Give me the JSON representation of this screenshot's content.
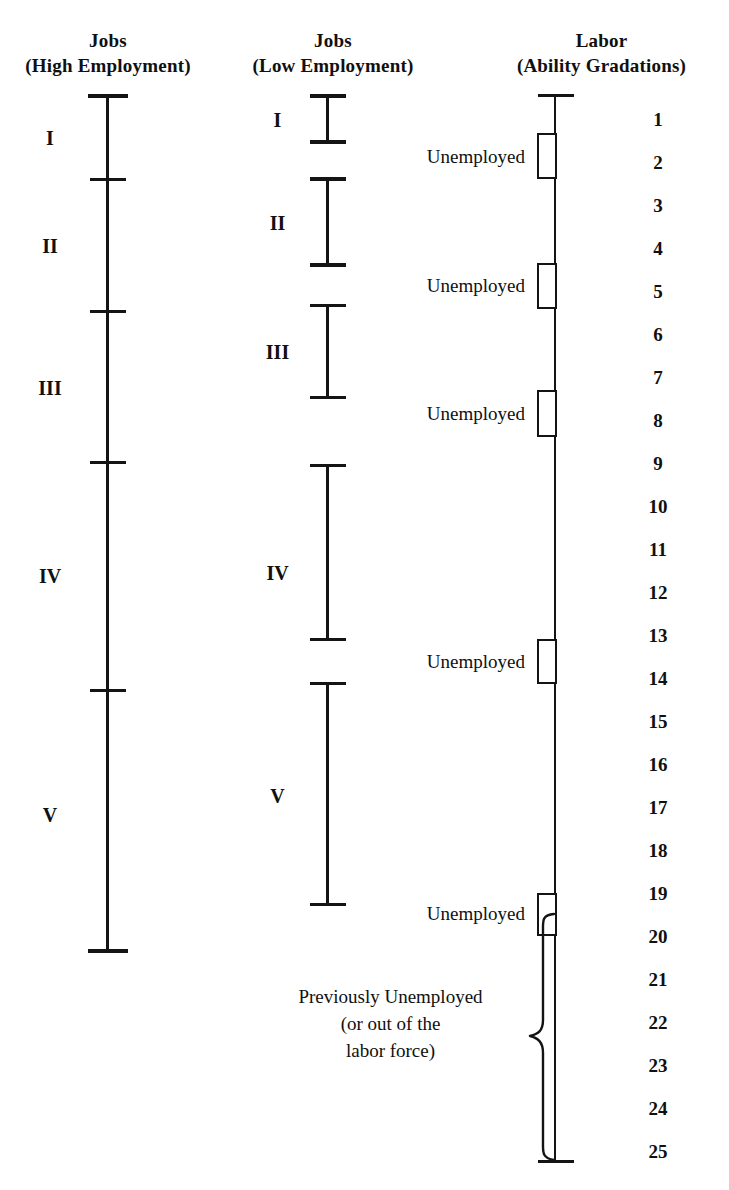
{
  "figure": {
    "title_hidden": "",
    "columns": [
      {
        "id": "jobs-high",
        "title_line1": "Jobs",
        "title_line2": "(High Employment)"
      },
      {
        "id": "jobs-low",
        "title_line1": "Jobs",
        "title_line2": "(Low Employment)"
      },
      {
        "id": "labor",
        "title_line1": "Labor",
        "title_line2": "(Ability Gradations)"
      }
    ]
  },
  "jobs_high": {
    "segments": [
      {
        "label": "I"
      },
      {
        "label": "II"
      },
      {
        "label": "III"
      },
      {
        "label": "IV"
      },
      {
        "label": "V"
      }
    ]
  },
  "jobs_low": {
    "segments": [
      {
        "label": "I"
      },
      {
        "label": "II"
      },
      {
        "label": "III"
      },
      {
        "label": "IV"
      },
      {
        "label": "V"
      }
    ]
  },
  "labor": {
    "unemployed_labels": [
      {
        "text": "Unemployed"
      },
      {
        "text": "Unemployed"
      },
      {
        "text": "Unemployed"
      },
      {
        "text": "Unemployed"
      },
      {
        "text": "Unemployed"
      }
    ],
    "brace_label": "Previously Unemployed\n(or out of the\nlabor force)",
    "gradations": [
      "1",
      "2",
      "3",
      "4",
      "5",
      "6",
      "7",
      "8",
      "9",
      "10",
      "11",
      "12",
      "13",
      "14",
      "15",
      "16",
      "17",
      "18",
      "19",
      "20",
      "21",
      "22",
      "23",
      "24",
      "25"
    ]
  },
  "chart_data": {
    "type": "diagram",
    "series": [
      {
        "name": "Jobs (High Employment)",
        "note": "continuous axis with internal tick divisions",
        "segments": [
          {
            "label": "I",
            "top_grade": 1,
            "bottom_grade": 2
          },
          {
            "label": "II",
            "top_grade": 2,
            "bottom_grade": 5
          },
          {
            "label": "III",
            "top_grade": 5,
            "bottom_grade": 9
          },
          {
            "label": "IV",
            "top_grade": 9,
            "bottom_grade": 14
          },
          {
            "label": "V",
            "top_grade": 14,
            "bottom_grade": 25
          }
        ]
      },
      {
        "name": "Jobs (Low Employment)",
        "note": "separated segments with unemployment gaps between them",
        "segments": [
          {
            "label": "I",
            "top_grade": 1,
            "bottom_grade": 2
          },
          {
            "label": "II",
            "top_grade": 3,
            "bottom_grade": 5
          },
          {
            "label": "III",
            "top_grade": 6,
            "bottom_grade": 9
          },
          {
            "label": "IV",
            "top_grade": 10,
            "bottom_grade": 14
          },
          {
            "label": "V",
            "top_grade": 15,
            "bottom_grade": 20
          }
        ]
      },
      {
        "name": "Labor (Ability Gradations)",
        "note": "continuous axis, grades 1 through 25, with 5 unemployment brackets and a bottom brace",
        "unemployed_brackets": [
          {
            "label": "Unemployed",
            "near_grade": 2
          },
          {
            "label": "Unemployed",
            "near_grade": 5
          },
          {
            "label": "Unemployed",
            "near_grade": 9
          },
          {
            "label": "Unemployed",
            "near_grade": 14
          },
          {
            "label": "Unemployed",
            "near_grade": 20
          }
        ],
        "brace": {
          "label": "Previously Unemployed (or out of the labor force)",
          "from_grade": 21,
          "to_grade": 25
        }
      }
    ]
  }
}
